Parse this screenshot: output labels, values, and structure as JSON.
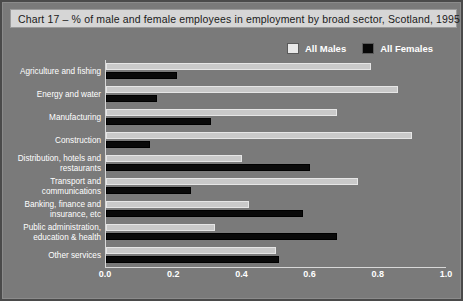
{
  "figure": {
    "title": "Chart 17 – % of male and female employees in employment by broad sector, Scotland, 1995",
    "background_color": "#7a7a7a",
    "title_bar_color": "#d6d6d6"
  },
  "legend": {
    "position": "top-right",
    "entries": [
      {
        "label": "All Males",
        "color": "#e8e8e8",
        "swatch": "males"
      },
      {
        "label": "All Females",
        "color": "#070707",
        "swatch": "females"
      }
    ]
  },
  "chart_data": {
    "type": "bar",
    "orientation": "horizontal",
    "title": "Chart 17 – % of male and female employees in employment by broad sector, Scotland, 1995",
    "xlabel": "",
    "ylabel": "",
    "xlim": [
      0.0,
      1.0
    ],
    "grid": false,
    "xticks": [
      "0.0",
      "0.2",
      "0.4",
      "0.6",
      "0.8",
      "1.0"
    ],
    "xtick_values": [
      0.0,
      0.2,
      0.4,
      0.6,
      0.8,
      1.0
    ],
    "categories": [
      "Agriculture and fishing",
      "Energy and water",
      "Manufacturing",
      "Construction",
      "Distribution, hotels and restaurants",
      "Transport and communications",
      "Banking, finance and insurance, etc",
      "Public administration, education & health",
      "Other services"
    ],
    "series": [
      {
        "name": "All Males",
        "color": "#e8e8e8",
        "values": [
          0.78,
          0.86,
          0.68,
          0.9,
          0.4,
          0.74,
          0.42,
          0.32,
          0.5
        ]
      },
      {
        "name": "All Females",
        "color": "#070707",
        "values": [
          0.21,
          0.15,
          0.31,
          0.13,
          0.6,
          0.25,
          0.58,
          0.68,
          0.51
        ]
      }
    ]
  }
}
